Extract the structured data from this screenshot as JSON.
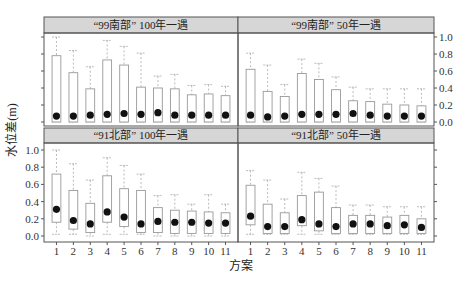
{
  "chart_data": {
    "type": "boxplot",
    "layout": "2x2 facet grid",
    "xlabel": "方案",
    "ylabel": "水位差(m)",
    "categories": [
      "1",
      "2",
      "3",
      "4",
      "5",
      "6",
      "7",
      "8",
      "9",
      "10",
      "11"
    ],
    "ylim": [
      0,
      1.0
    ],
    "yticks": [
      "0.0",
      "0.2",
      "0.4",
      "0.6",
      "0.8",
      "1.0"
    ],
    "panels": [
      {
        "title": "“99南部” 100年一遇",
        "position": "top-left",
        "whisker_high": [
          1.0,
          0.84,
          0.65,
          0.96,
          0.89,
          0.81,
          0.54,
          0.56,
          0.43,
          0.44,
          0.42
        ],
        "q3": [
          0.78,
          0.58,
          0.39,
          0.73,
          0.67,
          0.41,
          0.4,
          0.39,
          0.32,
          0.33,
          0.31
        ],
        "q1": [
          0.0,
          0.0,
          0.0,
          0.0,
          0.0,
          0.0,
          0.0,
          0.0,
          0.0,
          0.0,
          0.0
        ],
        "whisker_low": [
          0.0,
          0.0,
          0.0,
          0.0,
          0.0,
          0.0,
          0.0,
          0.0,
          0.0,
          0.0,
          0.0
        ],
        "mean": [
          0.07,
          0.07,
          0.08,
          0.09,
          0.1,
          0.09,
          0.11,
          0.08,
          0.08,
          0.08,
          0.08
        ]
      },
      {
        "title": "“99南部” 50年一遇",
        "position": "top-right",
        "whisker_high": [
          0.81,
          0.67,
          0.44,
          0.74,
          0.69,
          0.53,
          0.41,
          0.39,
          0.39,
          0.39,
          0.39
        ],
        "q3": [
          0.62,
          0.36,
          0.3,
          0.57,
          0.5,
          0.38,
          0.25,
          0.24,
          0.21,
          0.2,
          0.19
        ],
        "q1": [
          0.0,
          0.0,
          0.0,
          0.0,
          0.0,
          0.0,
          0.0,
          0.0,
          0.0,
          0.0,
          0.0
        ],
        "whisker_low": [
          0.0,
          0.0,
          0.0,
          0.0,
          0.0,
          0.0,
          0.0,
          0.0,
          0.0,
          0.0,
          0.0
        ],
        "mean": [
          0.08,
          0.06,
          0.07,
          0.09,
          0.09,
          0.09,
          0.1,
          0.08,
          0.07,
          0.07,
          0.07
        ]
      },
      {
        "title": "“91北部” 100年一遇",
        "position": "bottom-left",
        "whisker_high": [
          1.0,
          0.84,
          0.65,
          0.91,
          0.82,
          0.72,
          0.47,
          0.48,
          0.37,
          0.48,
          0.37
        ],
        "q3": [
          0.72,
          0.53,
          0.38,
          0.7,
          0.55,
          0.53,
          0.33,
          0.3,
          0.29,
          0.28,
          0.27
        ],
        "q1": [
          0.16,
          0.08,
          0.04,
          0.16,
          0.11,
          0.04,
          0.04,
          0.03,
          0.03,
          0.03,
          0.03
        ],
        "whisker_low": [
          0.02,
          0.02,
          0.0,
          0.02,
          0.02,
          0.02,
          0.0,
          0.0,
          0.0,
          0.0,
          0.0
        ],
        "mean": [
          0.31,
          0.18,
          0.14,
          0.28,
          0.22,
          0.14,
          0.17,
          0.16,
          0.16,
          0.15,
          0.15
        ]
      },
      {
        "title": "“91北部” 50年一遇",
        "position": "bottom-right",
        "whisker_high": [
          0.76,
          0.65,
          0.43,
          0.74,
          0.67,
          0.58,
          0.36,
          0.36,
          0.34,
          0.34,
          0.34
        ],
        "q3": [
          0.59,
          0.37,
          0.27,
          0.47,
          0.51,
          0.33,
          0.24,
          0.24,
          0.22,
          0.24,
          0.2
        ],
        "q1": [
          0.13,
          0.03,
          0.03,
          0.12,
          0.06,
          0.03,
          0.03,
          0.03,
          0.03,
          0.03,
          0.03
        ],
        "whisker_low": [
          0.02,
          0.02,
          0.02,
          0.02,
          0.02,
          0.02,
          0.02,
          0.02,
          0.02,
          0.02,
          0.02
        ],
        "mean": [
          0.23,
          0.11,
          0.11,
          0.19,
          0.14,
          0.11,
          0.14,
          0.14,
          0.12,
          0.13,
          0.1
        ]
      }
    ],
    "grid": false,
    "legend": null
  },
  "colors": {
    "strip_bg": "#d6d6d6",
    "frame": "#555555",
    "box_stroke": "#999999",
    "whisker": "#aaaaaa",
    "mean_dot": "#111111"
  }
}
